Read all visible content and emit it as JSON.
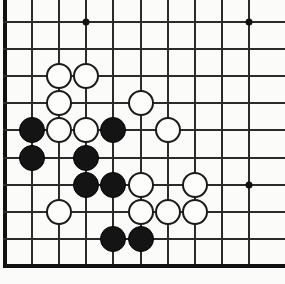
{
  "board": {
    "title": "Go board position",
    "game": "Go",
    "view": "corner-crop",
    "visible_columns": 10,
    "visible_rows": 10,
    "origin_px": {
      "x": 5,
      "y": 22
    },
    "spacing_px": 27.1,
    "stone_diameter_px": 26,
    "colors": {
      "background": "#fbfbf9",
      "line": "#2b2b2b",
      "edge_line": "#111111",
      "black_stone": "#141414",
      "white_stone": "#fdfdfb",
      "white_stone_border": "#1a1a1a"
    },
    "edges": {
      "left": true,
      "bottom": true,
      "top": false,
      "right": false
    },
    "star_points": [
      {
        "col": 3,
        "row": 0
      },
      {
        "col": 9,
        "row": 0
      },
      {
        "col": 9,
        "row": 6
      }
    ],
    "stones": [
      {
        "color": "white",
        "col": 2,
        "row": 2
      },
      {
        "color": "white",
        "col": 3,
        "row": 2
      },
      {
        "color": "white",
        "col": 2,
        "row": 3
      },
      {
        "color": "white",
        "col": 5,
        "row": 3
      },
      {
        "color": "black",
        "col": 1,
        "row": 4
      },
      {
        "color": "white",
        "col": 2,
        "row": 4
      },
      {
        "color": "white",
        "col": 3,
        "row": 4
      },
      {
        "color": "black",
        "col": 4,
        "row": 4
      },
      {
        "color": "white",
        "col": 6,
        "row": 4
      },
      {
        "color": "black",
        "col": 1,
        "row": 5
      },
      {
        "color": "black",
        "col": 3,
        "row": 5
      },
      {
        "color": "black",
        "col": 3,
        "row": 6
      },
      {
        "color": "black",
        "col": 4,
        "row": 6
      },
      {
        "color": "white",
        "col": 5,
        "row": 6
      },
      {
        "color": "white",
        "col": 7,
        "row": 6
      },
      {
        "color": "white",
        "col": 2,
        "row": 7
      },
      {
        "color": "white",
        "col": 5,
        "row": 7
      },
      {
        "color": "white",
        "col": 6,
        "row": 7
      },
      {
        "color": "white",
        "col": 7,
        "row": 7
      },
      {
        "color": "black",
        "col": 4,
        "row": 8
      },
      {
        "color": "black",
        "col": 5,
        "row": 8
      }
    ],
    "counts": {
      "black": 8,
      "white": 13,
      "total": 21
    }
  }
}
